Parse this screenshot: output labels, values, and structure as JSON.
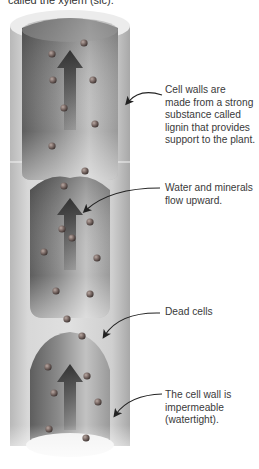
{
  "top_caption": "called the xylem (sic).",
  "annotations": [
    {
      "id": "cell-walls",
      "text_lines": [
        "Cell walls are",
        "made from a strong",
        "substance called",
        "lignin that provides",
        "support to the plant."
      ]
    },
    {
      "id": "water-flow",
      "text_lines": [
        "Water and minerals",
        "flow upward."
      ]
    },
    {
      "id": "dead-cells",
      "text_lines": [
        "Dead cells"
      ]
    },
    {
      "id": "impermeable",
      "text_lines": [
        "The cell wall is",
        "impermeable",
        "(watertight)."
      ]
    }
  ],
  "colors": {
    "wall_light": "#e2e2e2",
    "wall_mid": "#c6c6c6",
    "wall_shadow": "#a9a9a9",
    "cavity_dark": "#6a6a6a",
    "cavity_light": "#d4d4d4",
    "arrow": "#3c3c3c",
    "sphere": "#7a6a66",
    "leader_line": "#222222",
    "text": "#3a3a3a"
  }
}
